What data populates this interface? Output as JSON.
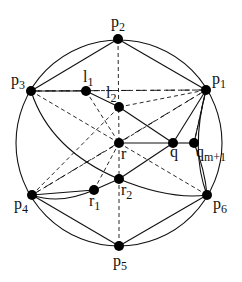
{
  "diagram": {
    "type": "geometric-graph",
    "circle": {
      "cx": 119,
      "cy": 143,
      "r": 103
    },
    "colors": {
      "stroke": "#111111",
      "node": "#000000",
      "background": "#ffffff"
    },
    "nodes": [
      {
        "id": "p1",
        "label": "p",
        "sub": "1",
        "x": 206,
        "y": 90,
        "lx": 212,
        "ly": 84
      },
      {
        "id": "p2",
        "label": "p",
        "sub": "2",
        "x": 118,
        "y": 39,
        "lx": 111,
        "ly": 27
      },
      {
        "id": "p3",
        "label": "p",
        "sub": "3",
        "x": 31,
        "y": 91,
        "lx": 11,
        "ly": 85
      },
      {
        "id": "p4",
        "label": "p",
        "sub": "4",
        "x": 32,
        "y": 195,
        "lx": 14,
        "ly": 209
      },
      {
        "id": "p5",
        "label": "p",
        "sub": "5",
        "x": 119,
        "y": 246,
        "lx": 113,
        "ly": 266
      },
      {
        "id": "p6",
        "label": "p",
        "sub": "6",
        "x": 207,
        "y": 195,
        "lx": 213,
        "ly": 209
      },
      {
        "id": "l1",
        "label": "l",
        "sub": "1",
        "x": 86,
        "y": 91,
        "lx": 83,
        "ly": 82
      },
      {
        "id": "l2",
        "label": "l",
        "sub": "2",
        "x": 119,
        "y": 107,
        "lx": 106,
        "ly": 98
      },
      {
        "id": "r",
        "label": "r",
        "sub": "",
        "x": 119,
        "y": 143,
        "lx": 121,
        "ly": 159
      },
      {
        "id": "q",
        "label": "q",
        "sub": "",
        "x": 173,
        "y": 143,
        "lx": 170,
        "ly": 157
      },
      {
        "id": "qm1",
        "label": "q",
        "sub": "m+1",
        "x": 194,
        "y": 143,
        "lx": 196,
        "ly": 157
      },
      {
        "id": "r2",
        "label": "r",
        "sub": "2",
        "x": 119,
        "y": 179,
        "lx": 121,
        "ly": 195
      },
      {
        "id": "r1",
        "label": "r",
        "sub": "1",
        "x": 94,
        "y": 190,
        "lx": 89,
        "ly": 206
      }
    ],
    "solid_edges": [
      [
        "p3",
        "p2"
      ],
      [
        "p2",
        "p1"
      ],
      [
        "p4",
        "p5"
      ],
      [
        "p5",
        "p6"
      ],
      [
        "p3",
        "l1"
      ],
      [
        "l1",
        "l2"
      ],
      [
        "l2",
        "q"
      ],
      [
        "r",
        "q"
      ],
      [
        "q",
        "qm1"
      ],
      [
        "q",
        "r2"
      ],
      [
        "r2",
        "r1"
      ],
      [
        "r1",
        "p4"
      ],
      [
        "p1",
        "qm1"
      ],
      [
        "p1",
        "q"
      ]
    ],
    "curved_edges": [
      {
        "from": "p3",
        "to": "r2",
        "cx": 50,
        "cy": 150
      },
      {
        "from": "r2",
        "to": "p6",
        "cx": 170,
        "cy": 200
      },
      {
        "from": "p4",
        "to": "r1",
        "cx": 60,
        "cy": 205
      },
      {
        "from": "p1",
        "to": "p6",
        "cx": 190,
        "cy": 150
      },
      {
        "from": "qm1",
        "to": "p6",
        "cx": 205,
        "cy": 170
      }
    ],
    "dashed_edges": [
      [
        "p2",
        "r"
      ],
      [
        "r",
        "p5"
      ],
      [
        "p3",
        "r"
      ],
      [
        "r",
        "p6"
      ],
      [
        "p1",
        "r"
      ],
      [
        "r",
        "p4"
      ],
      [
        "l1",
        "r"
      ],
      [
        "r",
        "r1"
      ],
      [
        "p3",
        "p1"
      ],
      [
        "l2",
        "p1"
      ],
      [
        "p4",
        "l2"
      ],
      [
        "qm1",
        "p1"
      ]
    ],
    "long_dash_edges": [
      [
        "p3",
        "p1"
      ],
      [
        "p4",
        "p1"
      ]
    ]
  }
}
